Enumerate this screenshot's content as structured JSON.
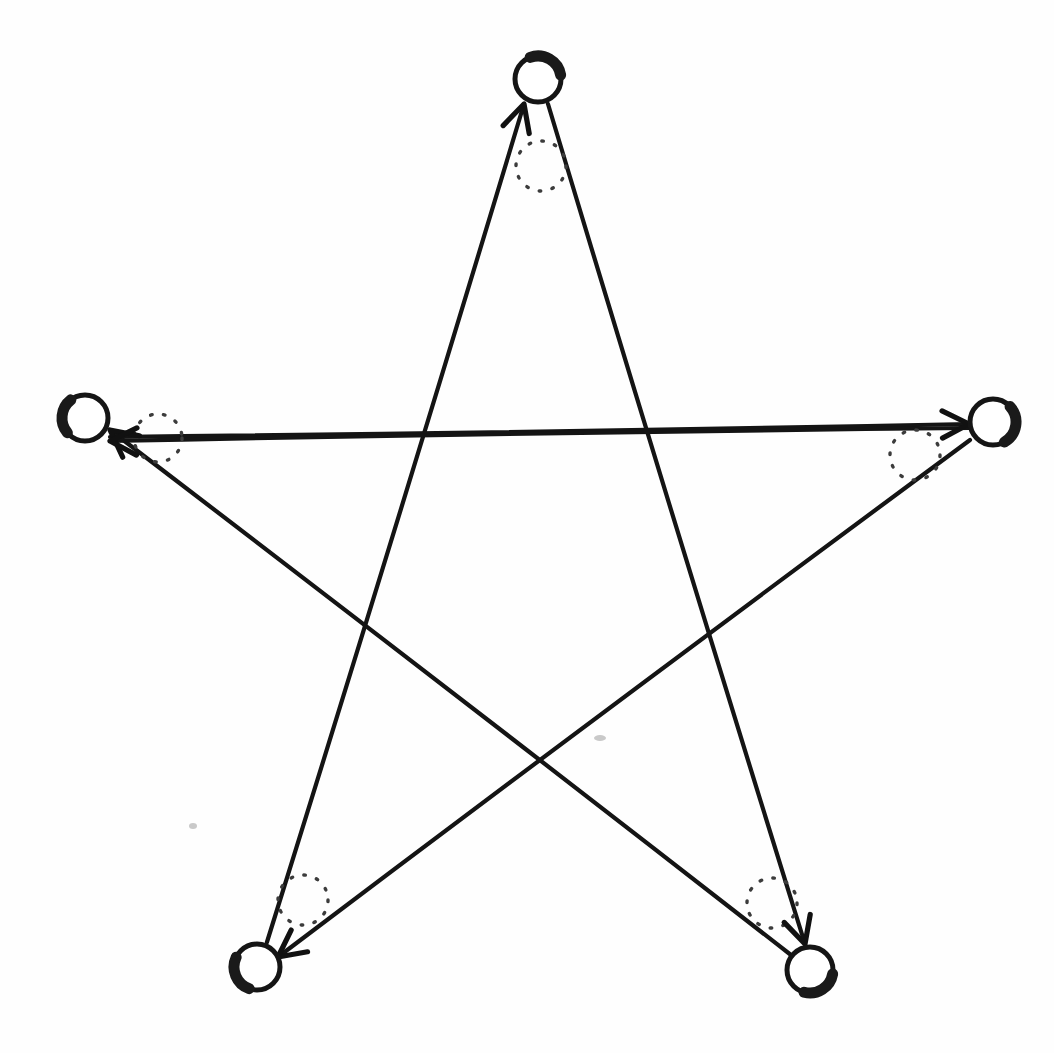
{
  "figure": {
    "kind": "hand-drawn-diagram",
    "width": 1054,
    "height": 1053,
    "background_color": "#fefefe",
    "ink_color": "#141414",
    "marker_color": "#3c3c3c"
  },
  "nodes": [
    {
      "id": "top",
      "label": "",
      "cx": 538,
      "cy": 79,
      "r": 23,
      "shade": "top",
      "shade_start_deg": 250,
      "shade_end_deg": 350
    },
    {
      "id": "right",
      "label": "",
      "cx": 993,
      "cy": 422,
      "r": 23,
      "shade": "right",
      "shade_start_deg": 318,
      "shade_end_deg": 60
    },
    {
      "id": "bottom-right",
      "label": "",
      "cx": 810,
      "cy": 970,
      "r": 23,
      "shade": "bottom-right",
      "shade_start_deg": 10,
      "shade_end_deg": 105
    },
    {
      "id": "bottom-left",
      "label": "",
      "cx": 257,
      "cy": 967,
      "r": 23,
      "shade": "bottom-left",
      "shade_start_deg": 110,
      "shade_end_deg": 205
    },
    {
      "id": "left",
      "label": "",
      "cx": 85,
      "cy": 418,
      "r": 23,
      "shade": "left",
      "shade_start_deg": 140,
      "shade_end_deg": 232
    }
  ],
  "edges": [
    {
      "id": "edge-bottomleft-to-top",
      "from": "bottom-left",
      "to": "top",
      "x1": 267,
      "y1": 942,
      "x2": 524,
      "y2": 104,
      "arrow_at": "top",
      "arrow_angle_deg": 287,
      "marker": {
        "cx": 541,
        "cy": 166,
        "r": 25
      }
    },
    {
      "id": "edge-top-to-bottomright",
      "from": "top",
      "to": "bottom-right",
      "x1": 548,
      "y1": 104,
      "x2": 805,
      "y2": 944,
      "arrow_at": "bottom-right",
      "arrow_angle_deg": 73,
      "marker": {
        "cx": 772,
        "cy": 903,
        "r": 25
      }
    },
    {
      "id": "edge-bottomright-to-left",
      "from": "bottom-right",
      "to": "left",
      "x1": 791,
      "y1": 955,
      "x2": 110,
      "y2": 430,
      "arrow_at": "left",
      "arrow_angle_deg": 218,
      "marker": {
        "cx": 303,
        "cy": 900,
        "r": 25
      }
    },
    {
      "id": "edge-left-to-right",
      "from": "left",
      "to": "right",
      "x1": 110,
      "y1": 437,
      "x2": 969,
      "y2": 424,
      "arrow_at": "right",
      "arrow_angle_deg": 359,
      "marker": {
        "cx": 915,
        "cy": 455,
        "r": 25
      }
    },
    {
      "id": "edge-right-to-left-horizontal",
      "from": "right",
      "to": "left",
      "x1": 969,
      "y1": 428,
      "x2": 110,
      "y2": 441,
      "arrow_at": "left",
      "arrow_angle_deg": 181,
      "marker": {
        "cx": 158,
        "cy": 438,
        "r": 25
      }
    },
    {
      "id": "edge-right-to-bottomleft",
      "from": "right",
      "to": "bottom-left",
      "x1": 970,
      "y1": 440,
      "x2": 278,
      "y2": 957,
      "arrow_at": "bottom-left",
      "arrow_angle_deg": 143,
      "marker": {
        "cx": 303,
        "cy": 900,
        "r": 25
      }
    }
  ],
  "dotted_markers": [
    {
      "id": "marker-top",
      "cx": 541,
      "cy": 166,
      "r": 25
    },
    {
      "id": "marker-left",
      "cx": 158,
      "cy": 438,
      "r": 24
    },
    {
      "id": "marker-right",
      "cx": 915,
      "cy": 455,
      "r": 25
    },
    {
      "id": "marker-bottom-left",
      "cx": 303,
      "cy": 900,
      "r": 25
    },
    {
      "id": "marker-bottom-right",
      "cx": 772,
      "cy": 903,
      "r": 25
    }
  ],
  "specks": [
    {
      "cx": 600,
      "cy": 738,
      "rx": 6,
      "ry": 3
    },
    {
      "cx": 193,
      "cy": 826,
      "rx": 4,
      "ry": 3
    }
  ]
}
